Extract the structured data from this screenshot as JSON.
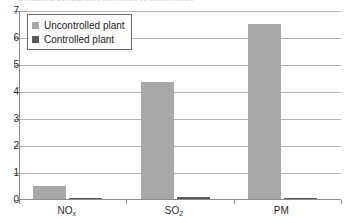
{
  "chart_data": {
    "type": "bar",
    "title": "Emissions comparison, controlled vs uncontrolled",
    "xlabel": "",
    "ylabel": "",
    "ylim": [
      0,
      7
    ],
    "yticks": [
      0,
      1,
      2,
      3,
      4,
      5,
      6,
      7
    ],
    "ytick_labels": [
      "0",
      "1",
      "2",
      "3",
      "4",
      "5",
      "6",
      "7"
    ],
    "grid": true,
    "legend_position": "upper-left-inside",
    "categories": [
      "NOx",
      "SO2",
      "PM"
    ],
    "category_labels": [
      {
        "base": "NO",
        "sub": "x"
      },
      {
        "base": "SO",
        "sub": "2"
      },
      {
        "base": "PM",
        "sub": ""
      }
    ],
    "series": [
      {
        "name": "Uncontrolled plant",
        "color": "#a8a8a8",
        "values": [
          0.5,
          4.35,
          6.5
        ]
      },
      {
        "name": "Controlled plant",
        "color": "#595959",
        "values": [
          0.05,
          0.08,
          0.01
        ]
      }
    ]
  },
  "legend": {
    "items": [
      {
        "label": "Uncontrolled plant",
        "color": "#a8a8a8"
      },
      {
        "label": "Controlled plant",
        "color": "#595959"
      }
    ]
  }
}
